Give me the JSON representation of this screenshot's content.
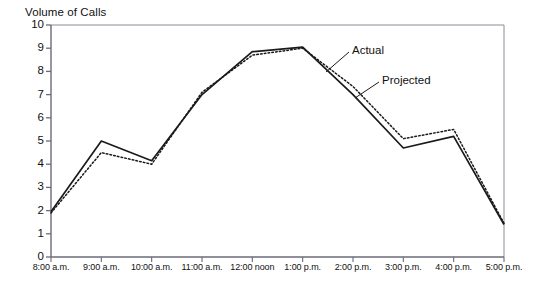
{
  "chart_data": {
    "type": "line",
    "title": "",
    "ylabel": "Volume of Calls",
    "xlabel": "Time of Day",
    "categories": [
      "8:00 a.m.",
      "9:00 a.m.",
      "10:00 a.m.",
      "11:00 a.m.",
      "12:00 noon",
      "1:00 p.m.",
      "2:00 p.m.",
      "3:00 p.m.",
      "4:00 p.m.",
      "5:00 p.m."
    ],
    "ylim": [
      0,
      10
    ],
    "xlim_categories": [
      0,
      9
    ],
    "ytick_labels": [
      "0",
      "1",
      "2",
      "3",
      "4",
      "5",
      "6",
      "7",
      "8",
      "9",
      "10"
    ],
    "ytick_values": [
      0,
      1,
      2,
      3,
      4,
      5,
      6,
      7,
      8,
      9,
      10
    ],
    "grid": false,
    "legend_position": "inline-annotations",
    "series": [
      {
        "name": "Actual",
        "style": "solid",
        "color": "#1a1a1a",
        "values": [
          1.95,
          5.0,
          4.15,
          7.0,
          8.85,
          9.05,
          7.0,
          4.7,
          5.2,
          1.4
        ]
      },
      {
        "name": "Projected",
        "style": "dotted",
        "color": "#1a1a1a",
        "values": [
          1.9,
          4.5,
          4.0,
          7.1,
          8.7,
          9.0,
          7.35,
          5.1,
          5.5,
          1.45
        ]
      }
    ],
    "annotations": [
      {
        "text": "Actual",
        "target_series": "Actual"
      },
      {
        "text": "Projected",
        "target_series": "Projected"
      }
    ]
  },
  "axes": {
    "y_title": "Volume of Calls",
    "x_title": "Time of Day"
  },
  "colors": {
    "line": "#1a1a1a",
    "axis": "#6b6b7a",
    "frame": "#8a8a96",
    "text": "#111111",
    "background": "#ffffff"
  }
}
